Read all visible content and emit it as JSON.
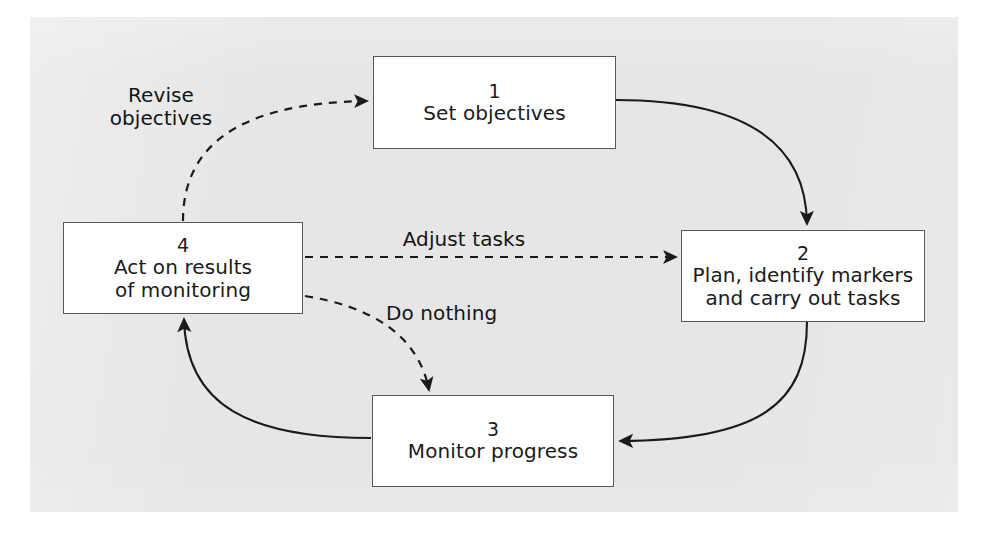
{
  "figure": {
    "panel_color": "#e6e6e6",
    "box_fill": "#ffffff",
    "box_stroke": "#585858",
    "line_color": "#1a1a1a",
    "text_color": "#1a1a1a"
  },
  "nodes": [
    {
      "id": "node1",
      "number": "1",
      "label": "Set objectives",
      "x": 373,
      "y": 56,
      "w": 243,
      "h": 93
    },
    {
      "id": "node2",
      "number": "2",
      "label": "Plan, identify markers\nand carry out tasks",
      "x": 681,
      "y": 230,
      "w": 244,
      "h": 92
    },
    {
      "id": "node3",
      "number": "3",
      "label": "Monitor progress",
      "x": 372,
      "y": 395,
      "w": 242,
      "h": 92
    },
    {
      "id": "node4",
      "number": "4",
      "label": "Act on results\nof monitoring",
      "x": 63,
      "y": 222,
      "w": 240,
      "h": 92
    }
  ],
  "edges": [
    {
      "id": "edge-1-to-2",
      "from": "node1",
      "to": "node2",
      "style": "solid",
      "label": ""
    },
    {
      "id": "edge-2-to-3",
      "from": "node2",
      "to": "node3",
      "style": "solid",
      "label": ""
    },
    {
      "id": "edge-3-to-4",
      "from": "node3",
      "to": "node4",
      "style": "solid",
      "label": ""
    },
    {
      "id": "edge-4-to-1",
      "from": "node4",
      "to": "node1",
      "style": "dashed",
      "label": "Revise\nobjectives"
    },
    {
      "id": "edge-4-to-2",
      "from": "node4",
      "to": "node2",
      "style": "dashed",
      "label": "Adjust tasks"
    },
    {
      "id": "edge-4-to-3",
      "from": "node4",
      "to": "node3",
      "style": "dashed",
      "label": "Do nothing"
    }
  ],
  "edge_labels": {
    "revise": "Revise\nobjectives",
    "adjust": "Adjust tasks",
    "do_nothing": "Do nothing"
  }
}
